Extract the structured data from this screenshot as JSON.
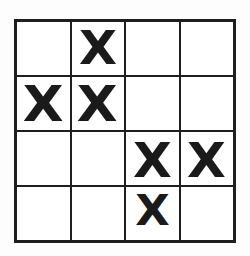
{
  "figure": {
    "kind": "marked-grid",
    "rows": 4,
    "columns": 4,
    "mark_symbol": "X",
    "empty_symbol": "",
    "colors": {
      "background": "#fdfdfd",
      "cell_fill": "#ffffff",
      "grid_line": "#1e1e1e",
      "mark": "#1a1a1a"
    },
    "grid": [
      {
        "row_label": "row-1",
        "cells": [
          {
            "cell_label": "r1c1",
            "mark": ""
          },
          {
            "cell_label": "r1c2",
            "mark": "X"
          },
          {
            "cell_label": "r1c3",
            "mark": ""
          },
          {
            "cell_label": "r1c4",
            "mark": ""
          }
        ]
      },
      {
        "row_label": "row-2",
        "cells": [
          {
            "cell_label": "r2c1",
            "mark": "X"
          },
          {
            "cell_label": "r2c2",
            "mark": "X"
          },
          {
            "cell_label": "r2c3",
            "mark": ""
          },
          {
            "cell_label": "r2c4",
            "mark": ""
          }
        ]
      },
      {
        "row_label": "row-3",
        "cells": [
          {
            "cell_label": "r3c1",
            "mark": ""
          },
          {
            "cell_label": "r3c2",
            "mark": ""
          },
          {
            "cell_label": "r3c3",
            "mark": "X"
          },
          {
            "cell_label": "r3c4",
            "mark": "X"
          }
        ]
      },
      {
        "row_label": "row-4",
        "cells": [
          {
            "cell_label": "r4c1",
            "mark": ""
          },
          {
            "cell_label": "r4c2",
            "mark": ""
          },
          {
            "cell_label": "r4c3",
            "mark": "X"
          },
          {
            "cell_label": "r4c4",
            "mark": ""
          }
        ]
      }
    ],
    "mark_count": 6
  }
}
